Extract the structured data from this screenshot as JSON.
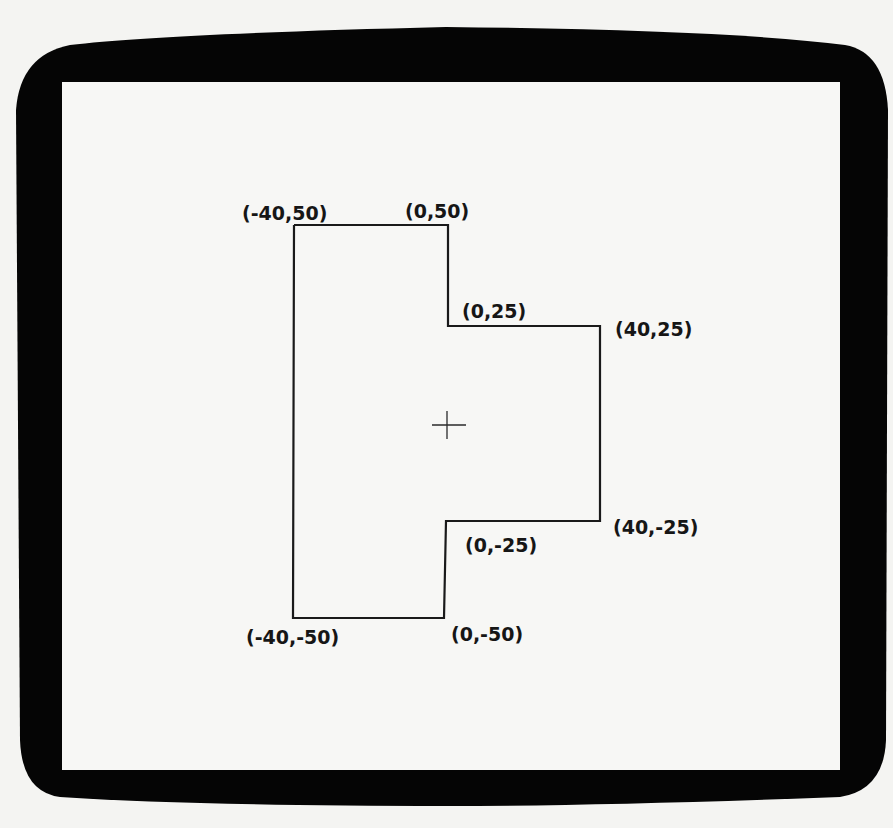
{
  "display": {
    "bezel_color": "#050505",
    "screen_color": "#f7f7f5",
    "background_color": "#f4f4f2",
    "ink_color": "#1a1a1a"
  },
  "diagram": {
    "title": "",
    "shape": "closed polygon (T-shaped outline) drawn on CRT screen",
    "origin_marker": "crosshair",
    "vertices": [
      {
        "x": -40,
        "y": 50,
        "label": "(-40,50)"
      },
      {
        "x": 0,
        "y": 50,
        "label": "(0,50)"
      },
      {
        "x": 0,
        "y": 25,
        "label": "(0,25)"
      },
      {
        "x": 40,
        "y": 25,
        "label": "(40,25)"
      },
      {
        "x": 40,
        "y": -25,
        "label": "(40,-25)"
      },
      {
        "x": 0,
        "y": -25,
        "label": "(0,-25)"
      },
      {
        "x": 0,
        "y": -50,
        "label": "(0,-50)"
      },
      {
        "x": -40,
        "y": -50,
        "label": "(-40,-50)"
      }
    ]
  },
  "labels": {
    "v1": "(-40,50)",
    "v2": "(0,50)",
    "v3": "(0,25)",
    "v4": "(40,25)",
    "v5": "(40,-25)",
    "v6": "(0,-25)",
    "v7": "(0,-50)",
    "v8": "(-40,-50)"
  }
}
